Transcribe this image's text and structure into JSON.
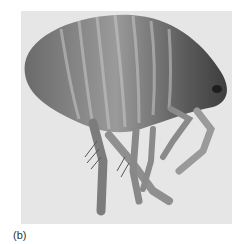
{
  "figure": {
    "label": "(b)",
    "colors": {
      "background": "#e6e6e6",
      "body_dark": "#4a4a4a",
      "body_mid": "#7a7a7a",
      "body_light": "#b5b5b5"
    }
  }
}
